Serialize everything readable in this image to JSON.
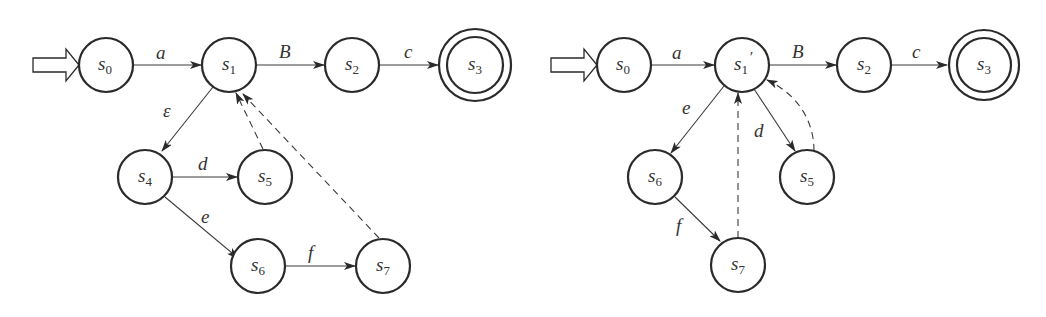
{
  "diagrams": [
    {
      "id": "left",
      "description": "NFA with epsilon transition before merging",
      "start_state": "s0",
      "accept_states": [
        "s3"
      ],
      "states": [
        {
          "id": "s0",
          "base": "s",
          "sub": "0",
          "prime": "",
          "x": 106,
          "y": 65
        },
        {
          "id": "s1",
          "base": "s",
          "sub": "1",
          "prime": "",
          "x": 229,
          "y": 65
        },
        {
          "id": "s2",
          "base": "s",
          "sub": "2",
          "prime": "",
          "x": 352,
          "y": 65
        },
        {
          "id": "s3",
          "base": "s",
          "sub": "3",
          "prime": "",
          "x": 475,
          "y": 65,
          "accept": true
        },
        {
          "id": "s4",
          "base": "s",
          "sub": "4",
          "prime": "",
          "x": 145,
          "y": 177
        },
        {
          "id": "s5",
          "base": "s",
          "sub": "5",
          "prime": "",
          "x": 265,
          "y": 177
        },
        {
          "id": "s6",
          "base": "s",
          "sub": "6",
          "prime": "",
          "x": 258,
          "y": 266
        },
        {
          "id": "s7",
          "base": "s",
          "sub": "7",
          "prime": "",
          "x": 383,
          "y": 266
        }
      ],
      "transitions": [
        {
          "from": "s0",
          "to": "s1",
          "label": "a",
          "style": "solid"
        },
        {
          "from": "s1",
          "to": "s2",
          "label": "B",
          "style": "solid"
        },
        {
          "from": "s2",
          "to": "s3",
          "label": "c",
          "style": "solid"
        },
        {
          "from": "s1",
          "to": "s4",
          "label": "ε",
          "style": "solid"
        },
        {
          "from": "s4",
          "to": "s5",
          "label": "d",
          "style": "solid"
        },
        {
          "from": "s4",
          "to": "s6",
          "label": "e",
          "style": "solid"
        },
        {
          "from": "s6",
          "to": "s7",
          "label": "f",
          "style": "solid"
        },
        {
          "from": "s5",
          "to": "s1",
          "label": "",
          "style": "dashed"
        },
        {
          "from": "s7",
          "to": "s1",
          "label": "",
          "style": "dashed"
        }
      ]
    },
    {
      "id": "right",
      "description": "Automaton after eliminating epsilon (merged state s1')",
      "start_state": "s0",
      "accept_states": [
        "s3"
      ],
      "states": [
        {
          "id": "s0",
          "base": "s",
          "sub": "0",
          "prime": "",
          "x": 624,
          "y": 65
        },
        {
          "id": "s1p",
          "base": "s",
          "sub": "1",
          "prime": "′",
          "x": 742,
          "y": 65
        },
        {
          "id": "s2",
          "base": "s",
          "sub": "2",
          "prime": "",
          "x": 864,
          "y": 65
        },
        {
          "id": "s3",
          "base": "s",
          "sub": "3",
          "prime": "",
          "x": 984,
          "y": 65,
          "accept": true
        },
        {
          "id": "s6",
          "base": "s",
          "sub": "6",
          "prime": "",
          "x": 655,
          "y": 177
        },
        {
          "id": "s5",
          "base": "s",
          "sub": "5",
          "prime": "",
          "x": 807,
          "y": 177
        },
        {
          "id": "s7",
          "base": "s",
          "sub": "7",
          "prime": "",
          "x": 738,
          "y": 265
        }
      ],
      "transitions": [
        {
          "from": "s0",
          "to": "s1p",
          "label": "a",
          "style": "solid"
        },
        {
          "from": "s1p",
          "to": "s2",
          "label": "B",
          "style": "solid"
        },
        {
          "from": "s2",
          "to": "s3",
          "label": "c",
          "style": "solid"
        },
        {
          "from": "s1p",
          "to": "s6",
          "label": "e",
          "style": "solid"
        },
        {
          "from": "s1p",
          "to": "s5",
          "label": "d",
          "style": "solid"
        },
        {
          "from": "s6",
          "to": "s7",
          "label": "f",
          "style": "solid"
        },
        {
          "from": "s7",
          "to": "s1p",
          "label": "",
          "style": "dashed"
        },
        {
          "from": "s5",
          "to": "s1p",
          "label": "",
          "style": "dashed-curved"
        }
      ]
    }
  ],
  "labels": {
    "left": {
      "a": "a",
      "B": "B",
      "c": "c",
      "eps": "ε",
      "d": "d",
      "e": "e",
      "f": "f",
      "s0": "s",
      "s0_sub": "0",
      "s1": "s",
      "s1_sub": "1",
      "s2": "s",
      "s2_sub": "2",
      "s3": "s",
      "s3_sub": "3",
      "s4": "s",
      "s4_sub": "4",
      "s5": "s",
      "s5_sub": "5",
      "s6": "s",
      "s6_sub": "6",
      "s7": "s",
      "s7_sub": "7"
    },
    "right": {
      "a": "a",
      "B": "B",
      "c": "c",
      "e": "e",
      "d": "d",
      "f": "f",
      "s0": "s",
      "s0_sub": "0",
      "s1": "s",
      "s1_sub": "1",
      "s1_prime": "′",
      "s2": "s",
      "s2_sub": "2",
      "s3": "s",
      "s3_sub": "3",
      "s5": "s",
      "s5_sub": "5",
      "s6": "s",
      "s6_sub": "6",
      "s7": "s",
      "s7_sub": "7"
    }
  },
  "colors": {
    "stroke": "#2a2a2a",
    "edge": "#3a3a3a",
    "text": "#333333",
    "background": "#ffffff"
  }
}
